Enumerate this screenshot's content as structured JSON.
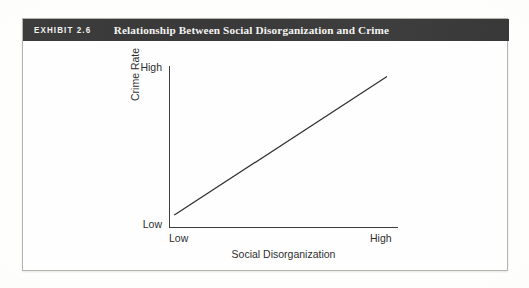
{
  "exhibit": {
    "number_label": "EXHIBIT 2.6",
    "title": "Relationship Between Social Disorganization and Crime",
    "header_background": "#3a3a3a",
    "header_text_color": "#f4f4f2"
  },
  "chart_data": {
    "type": "line",
    "title": "Relationship Between Social Disorganization and Crime",
    "xlabel": "Social Disorganization",
    "ylabel": "Crime Rate",
    "x_tick_labels": [
      "Low",
      "High"
    ],
    "y_tick_labels": [
      "Low",
      "High"
    ],
    "xlim": [
      0,
      1
    ],
    "ylim": [
      0,
      1
    ],
    "grid": false,
    "legend": null,
    "annotations": [],
    "series": [
      {
        "name": "Social disorganization vs. crime rate",
        "x": [
          0.02,
          1.0
        ],
        "y": [
          0.04,
          0.97
        ],
        "color": "#303030",
        "style": "solid",
        "description": "Straight positive-slope line indicating that as social disorganization increases, the crime rate increases."
      }
    ]
  },
  "axes": {
    "y_high": "High",
    "y_low": "Low",
    "x_low": "Low",
    "x_high": "High",
    "y_title": "Crime Rate",
    "x_title": "Social Disorganization",
    "axis_color": "#3d3d3d"
  }
}
